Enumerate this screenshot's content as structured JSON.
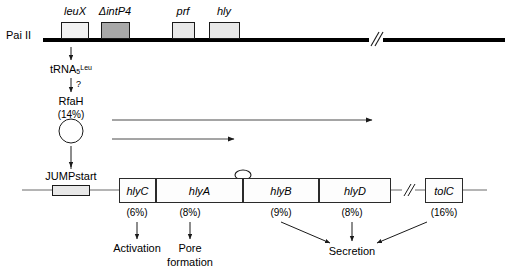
{
  "figure": {
    "island_label": "Pai II",
    "island_genes": [
      {
        "name": "leuX",
        "fill": "#f2f2f2"
      },
      {
        "name": "ΔintP4",
        "fill": "#a8a8a8"
      },
      {
        "name": "prf",
        "fill": "#e8e8e8"
      },
      {
        "name": "hly",
        "fill": "#e8e8e8"
      }
    ],
    "cascade": {
      "trna_base": "tRNA",
      "trna_sub": "5",
      "trna_sup": "Leu",
      "question_mark": "?",
      "regulator_name": "RfaH",
      "regulator_percent": "(14%)",
      "jumpstart_label": "JUMPstart"
    },
    "operon": [
      {
        "name": "hlyC",
        "percent": "(6%)"
      },
      {
        "name": "hlyA",
        "percent": "(8%)"
      },
      {
        "name": "hlyB",
        "percent": "(9%)"
      },
      {
        "name": "hlyD",
        "percent": "(8%)"
      },
      {
        "name": "tolC",
        "percent": "(16%)"
      }
    ],
    "functions": [
      {
        "label": "Activation"
      },
      {
        "label_line1": "Pore",
        "label_line2": "formation"
      },
      {
        "label": "Secretion"
      }
    ],
    "colors": {
      "line": "#1a1a1a",
      "bar": "#000000",
      "gene_fill": "#fdfdfd",
      "highlight_fill": "#a8a8a8"
    },
    "icons": {
      "terminator": "stem-loop-terminator-icon",
      "break": "sequence-break-icon"
    }
  }
}
